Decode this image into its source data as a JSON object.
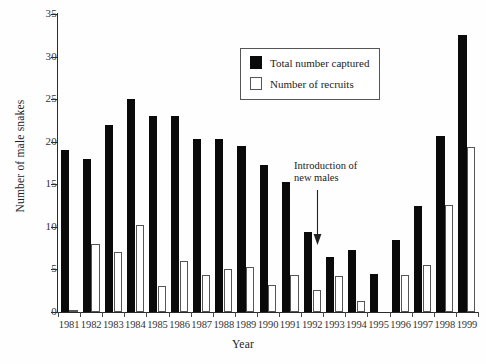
{
  "chart_data": {
    "type": "bar",
    "title": "",
    "xlabel": "Year",
    "ylabel": "Number of male snakes",
    "categories": [
      "1981",
      "1982",
      "1983",
      "1984",
      "1985",
      "1986",
      "1987",
      "1988",
      "1989",
      "1990",
      "1991",
      "1992",
      "1993",
      "1994",
      "1995",
      "1996",
      "1997",
      "1998",
      "1999"
    ],
    "series": [
      {
        "name": "Total number captured",
        "style": "filled-black",
        "color": "#0a0a0a",
        "values": [
          19,
          18,
          22,
          25,
          23,
          23,
          20.3,
          20.3,
          19.5,
          17.3,
          15.3,
          9.4,
          6.5,
          7.3,
          4.5,
          8.4,
          12.4,
          20.7,
          32.5
        ]
      },
      {
        "name": "Number of recruits",
        "style": "hollow-white",
        "color": "#ffffff",
        "values": [
          0.2,
          8,
          7,
          10.2,
          3,
          6,
          4.3,
          5,
          5.3,
          3.2,
          4.3,
          2.6,
          4.2,
          1.3,
          0,
          4.3,
          5.5,
          12.6,
          19.4
        ]
      }
    ],
    "ylim": [
      0,
      35
    ],
    "yticks": [
      0,
      5,
      10,
      15,
      20,
      25,
      30,
      35
    ],
    "ytick_labels": [
      "0",
      "5",
      "10",
      "15",
      "20",
      "25",
      "30",
      "35"
    ],
    "grid": false,
    "legend_position": "upper-center",
    "annotations": [
      {
        "text": "Introduction of\nnew males",
        "line1": "Introduction of",
        "line2": "new males",
        "arrow": "down-arrow",
        "points_to_year": "1992"
      }
    ]
  },
  "legend": {
    "entries": [
      {
        "label": "Total number captured",
        "swatch": "filled"
      },
      {
        "label": "Number of recruits",
        "swatch": "hollow"
      }
    ]
  },
  "axes": {
    "y_title": "Number of male snakes",
    "x_title": "Year"
  }
}
